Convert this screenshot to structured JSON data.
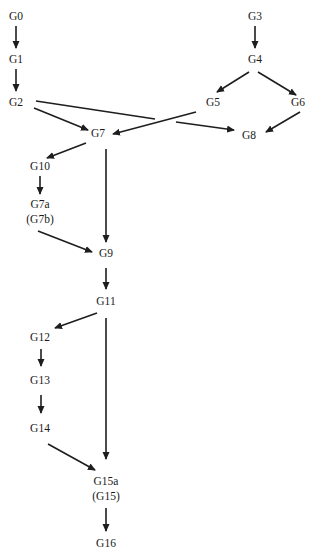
{
  "diagram": {
    "type": "directed-graph",
    "line_color": "#1e1e1e",
    "text_color": "#1a1a1a",
    "background": "#ffffff",
    "nodes": [
      {
        "id": "G0",
        "label": "G0",
        "x": 16,
        "y": 17
      },
      {
        "id": "G1",
        "label": "G1",
        "x": 16,
        "y": 60
      },
      {
        "id": "G2",
        "label": "G2",
        "x": 16,
        "y": 103
      },
      {
        "id": "G3",
        "label": "G3",
        "x": 255,
        "y": 17
      },
      {
        "id": "G4",
        "label": "G4",
        "x": 255,
        "y": 60
      },
      {
        "id": "G5",
        "label": "G5",
        "x": 213,
        "y": 103
      },
      {
        "id": "G6",
        "label": "G6",
        "x": 298,
        "y": 103
      },
      {
        "id": "G7",
        "label": "G7",
        "x": 98,
        "y": 134
      },
      {
        "id": "G8",
        "label": "G8",
        "x": 249,
        "y": 136
      },
      {
        "id": "G10",
        "label": "G10",
        "x": 40,
        "y": 167
      },
      {
        "id": "G7a",
        "label": "G7a",
        "sublabel": "(G7b)",
        "x": 40,
        "y": 205
      },
      {
        "id": "G9",
        "label": "G9",
        "x": 106,
        "y": 254
      },
      {
        "id": "G11",
        "label": "G11",
        "x": 106,
        "y": 302
      },
      {
        "id": "G12",
        "label": "G12",
        "x": 40,
        "y": 338
      },
      {
        "id": "G13",
        "label": "G13",
        "x": 40,
        "y": 381
      },
      {
        "id": "G14",
        "label": "G14",
        "x": 40,
        "y": 429
      },
      {
        "id": "G15a",
        "label": "G15a",
        "sublabel": "(G15)",
        "x": 106,
        "y": 482
      },
      {
        "id": "G16",
        "label": "G16",
        "x": 106,
        "y": 544
      }
    ],
    "edges": [
      {
        "from": "G0",
        "to": "G1",
        "x1": 16,
        "y1": 26,
        "x2": 16,
        "y2": 48
      },
      {
        "from": "G1",
        "to": "G2",
        "x1": 16,
        "y1": 69,
        "x2": 16,
        "y2": 91
      },
      {
        "from": "G2",
        "to": "G7",
        "x1": 34,
        "y1": 108,
        "x2": 88,
        "y2": 130
      },
      {
        "from": "G2",
        "to": "G8",
        "x1": 36,
        "y1": 101,
        "x2": 155,
        "y2": 119,
        "x3": 176,
        "y3": 122,
        "x4": 234,
        "y4": 130,
        "broken": true
      },
      {
        "from": "G3",
        "to": "G4",
        "x1": 255,
        "y1": 26,
        "x2": 255,
        "y2": 48
      },
      {
        "from": "G4",
        "to": "G5",
        "x1": 249,
        "y1": 72,
        "x2": 217,
        "y2": 92
      },
      {
        "from": "G4",
        "to": "G6",
        "x1": 258,
        "y1": 72,
        "x2": 296,
        "y2": 95
      },
      {
        "from": "G5",
        "to": "G7",
        "x1": 196,
        "y1": 112,
        "x2": 113,
        "y2": 134
      },
      {
        "from": "G6",
        "to": "G8",
        "x1": 300,
        "y1": 112,
        "x2": 266,
        "y2": 132
      },
      {
        "from": "G7",
        "to": "G10",
        "x1": 86,
        "y1": 143,
        "x2": 47,
        "y2": 158
      },
      {
        "from": "G7",
        "to": "G9",
        "x1": 106,
        "y1": 149,
        "x2": 106,
        "y2": 242
      },
      {
        "from": "G10",
        "to": "G7a",
        "x1": 40,
        "y1": 176,
        "x2": 40,
        "y2": 194
      },
      {
        "from": "G7a",
        "to": "G9",
        "x1": 38,
        "y1": 231,
        "x2": 92,
        "y2": 252
      },
      {
        "from": "G9",
        "to": "G11",
        "x1": 106,
        "y1": 268,
        "x2": 106,
        "y2": 289
      },
      {
        "from": "G11",
        "to": "G12",
        "x1": 97,
        "y1": 313,
        "x2": 55,
        "y2": 328
      },
      {
        "from": "G11",
        "to": "G15a",
        "x1": 106,
        "y1": 318,
        "x2": 106,
        "y2": 459
      },
      {
        "from": "G12",
        "to": "G13",
        "x1": 41,
        "y1": 349,
        "x2": 41,
        "y2": 366
      },
      {
        "from": "G13",
        "to": "G14",
        "x1": 41,
        "y1": 395,
        "x2": 41,
        "y2": 413
      },
      {
        "from": "G14",
        "to": "G15a",
        "x1": 48,
        "y1": 444,
        "x2": 95,
        "y2": 470
      },
      {
        "from": "G15a",
        "to": "G16",
        "x1": 106,
        "y1": 508,
        "x2": 106,
        "y2": 531
      }
    ]
  }
}
